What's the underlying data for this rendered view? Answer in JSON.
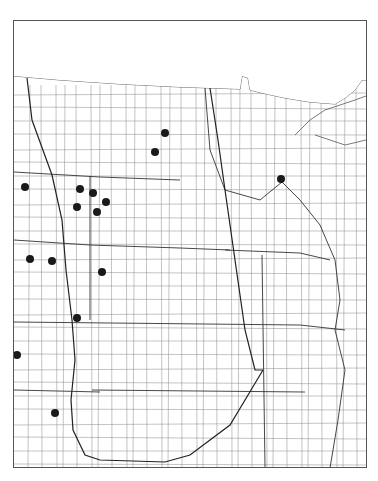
{
  "header": {
    "number": "2187.",
    "species": "Iris missouriensis",
    "author": "Nutt.",
    "common_name": "Blue Flag"
  },
  "map": {
    "description": "County outline map of north-central United States (Great Plains / upper Midwest) showing county records",
    "dot_color": "#1a1a1a",
    "line_color": "#555555",
    "occurrences": [
      {
        "x": 165,
        "y": 133
      },
      {
        "x": 155,
        "y": 152
      },
      {
        "x": 281,
        "y": 179
      },
      {
        "x": 25,
        "y": 187
      },
      {
        "x": 80,
        "y": 189
      },
      {
        "x": 93,
        "y": 193
      },
      {
        "x": 106,
        "y": 202
      },
      {
        "x": 77,
        "y": 207
      },
      {
        "x": 97,
        "y": 212
      },
      {
        "x": 30,
        "y": 259
      },
      {
        "x": 52,
        "y": 261
      },
      {
        "x": 102,
        "y": 272
      },
      {
        "x": 77,
        "y": 318
      },
      {
        "x": 17,
        "y": 355
      },
      {
        "x": 55,
        "y": 413
      }
    ]
  }
}
